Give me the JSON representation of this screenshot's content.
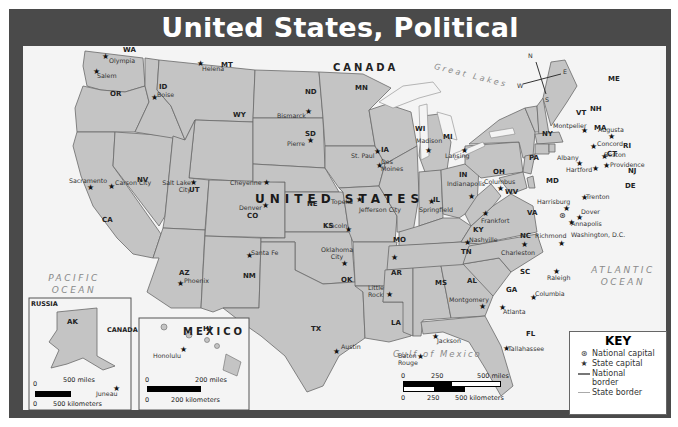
{
  "title": "United States, Political",
  "map": {
    "countries": {
      "canada": "CANADA",
      "mexico": "MEXICO",
      "united_states": "UNITED STATES"
    },
    "oceans": {
      "pacific": "PACIFIC OCEAN",
      "atlantic": "ATLANTIC OCEAN",
      "gulf": "Gulf of Mexico",
      "great_lakes": "Great Lakes"
    },
    "water_features": [
      "Missouri R.",
      "Snake R.",
      "Great Salt Lake",
      "Colorado R.",
      "Arkansas R.",
      "Rio Grande",
      "Mississippi R.",
      "Superior",
      "L. Michigan",
      "Huron",
      "Erie",
      "Ontario"
    ],
    "compass": {
      "n": "N",
      "e": "E",
      "s": "S",
      "w": "W"
    },
    "states": [
      {
        "abbr": "WA",
        "capital": "Olympia"
      },
      {
        "abbr": "OR",
        "capital": "Salem"
      },
      {
        "abbr": "CA",
        "capital": "Sacramento"
      },
      {
        "abbr": "NV",
        "capital": "Carson City"
      },
      {
        "abbr": "ID",
        "capital": "Boise"
      },
      {
        "abbr": "MT",
        "capital": "Helena"
      },
      {
        "abbr": "WY",
        "capital": "Cheyenne"
      },
      {
        "abbr": "UT",
        "capital": "Salt Lake City"
      },
      {
        "abbr": "AZ",
        "capital": "Phoenix"
      },
      {
        "abbr": "CO",
        "capital": "Denver"
      },
      {
        "abbr": "NM",
        "capital": "Santa Fe"
      },
      {
        "abbr": "ND",
        "capital": "Bismarck"
      },
      {
        "abbr": "SD",
        "capital": "Pierre"
      },
      {
        "abbr": "NE",
        "capital": "Lincoln"
      },
      {
        "abbr": "KS",
        "capital": "Topeka"
      },
      {
        "abbr": "OK",
        "capital": "Oklahoma City"
      },
      {
        "abbr": "TX",
        "capital": "Austin"
      },
      {
        "abbr": "MN",
        "capital": "St. Paul"
      },
      {
        "abbr": "IA",
        "capital": "Des Moines"
      },
      {
        "abbr": "MO",
        "capital": "Jefferson City"
      },
      {
        "abbr": "AR",
        "capital": "Little Rock"
      },
      {
        "abbr": "LA",
        "capital": "Baton Rouge"
      },
      {
        "abbr": "WI",
        "capital": "Madison"
      },
      {
        "abbr": "IL",
        "capital": "Springfield"
      },
      {
        "abbr": "MI",
        "capital": "Lansing"
      },
      {
        "abbr": "IN",
        "capital": "Indianapolis"
      },
      {
        "abbr": "OH",
        "capital": "Columbus"
      },
      {
        "abbr": "KY",
        "capital": "Frankfort"
      },
      {
        "abbr": "TN",
        "capital": "Nashville"
      },
      {
        "abbr": "MS",
        "capital": "Jackson"
      },
      {
        "abbr": "AL",
        "capital": "Montgomery"
      },
      {
        "abbr": "GA",
        "capital": "Atlanta"
      },
      {
        "abbr": "FL",
        "capital": "Tallahassee"
      },
      {
        "abbr": "SC",
        "capital": "Columbia"
      },
      {
        "abbr": "NC",
        "capital": "Raleigh"
      },
      {
        "abbr": "VA",
        "capital": "Richmond"
      },
      {
        "abbr": "WV",
        "capital": "Charleston"
      },
      {
        "abbr": "PA",
        "capital": "Harrisburg"
      },
      {
        "abbr": "NY",
        "capital": "Albany"
      },
      {
        "abbr": "VT",
        "capital": "Montpelier"
      },
      {
        "abbr": "NH",
        "capital": "Concord"
      },
      {
        "abbr": "ME",
        "capital": "Augusta"
      },
      {
        "abbr": "MA",
        "capital": "Boston"
      },
      {
        "abbr": "RI",
        "capital": "Providence"
      },
      {
        "abbr": "CT",
        "capital": "Hartford"
      },
      {
        "abbr": "NJ",
        "capital": "Trenton"
      },
      {
        "abbr": "DE",
        "capital": "Dover"
      },
      {
        "abbr": "MD",
        "capital": "Annapolis"
      },
      {
        "abbr": "AK",
        "capital": "Juneau"
      },
      {
        "abbr": "HI",
        "capital": "Honolulu"
      }
    ],
    "national_capital": "Washington, D.C.",
    "alaska_inset": {
      "russia": "RUSSIA",
      "canada": "CANADA",
      "scale_miles": "500 miles",
      "scale_km": "500 kilometers",
      "zero": "0"
    },
    "hawaii_inset": {
      "scale_miles": "200 miles",
      "scale_km": "200 kilometers",
      "zero": "0"
    },
    "main_scale": {
      "zero": "0",
      "mid_miles": "250",
      "miles": "500 miles",
      "mid_km": "250",
      "km": "500 kilometers"
    }
  },
  "key": {
    "title": "KEY",
    "items": [
      {
        "symbol": "national-capital",
        "label": "National capital"
      },
      {
        "symbol": "state-capital",
        "label": "State capital"
      },
      {
        "symbol": "national-border",
        "label": "National border"
      },
      {
        "symbol": "state-border",
        "label": "State border"
      }
    ]
  },
  "colors": {
    "frame": "#4a4a4a",
    "land_us": "#c4c4c4",
    "land_other": "#f4f4f4",
    "water": "#f4f4f4",
    "border": "#666666"
  }
}
